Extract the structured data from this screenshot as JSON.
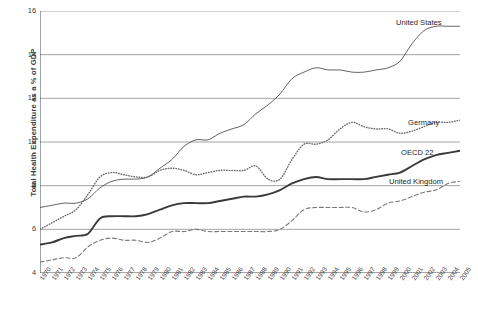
{
  "chart_data": {
    "type": "line",
    "title": "",
    "xlabel": "",
    "ylabel": "Total Health Expenditure as a % of GDP",
    "xlim": [
      1970,
      2005
    ],
    "ylim": [
      4,
      16
    ],
    "yticks": [
      4,
      6,
      8,
      10,
      12,
      14,
      16
    ],
    "grid": "horizontal",
    "legend_position": "inline-right-of-series",
    "x": [
      1970,
      1971,
      1972,
      1973,
      1974,
      1975,
      1976,
      1977,
      1978,
      1979,
      1980,
      1981,
      1982,
      1983,
      1984,
      1985,
      1986,
      1987,
      1988,
      1989,
      1990,
      1991,
      1992,
      1993,
      1994,
      1995,
      1996,
      1997,
      1998,
      1999,
      2000,
      2001,
      2002,
      2003,
      2004,
      2005
    ],
    "series": [
      {
        "name": "United States",
        "style": "solid-thin",
        "color": "#555555",
        "values": [
          7.0,
          7.1,
          7.2,
          7.2,
          7.4,
          7.9,
          8.2,
          8.3,
          8.3,
          8.4,
          8.8,
          9.2,
          9.8,
          10.1,
          10.1,
          10.4,
          10.6,
          10.8,
          11.3,
          11.7,
          12.2,
          12.9,
          13.2,
          13.4,
          13.3,
          13.3,
          13.2,
          13.2,
          13.3,
          13.4,
          13.7,
          14.5,
          15.1,
          15.3,
          15.3,
          15.3
        ]
      },
      {
        "name": "Germany",
        "style": "dotted",
        "color": "#6e6e6e",
        "values": [
          6.0,
          6.3,
          6.6,
          6.9,
          7.6,
          8.4,
          8.6,
          8.5,
          8.4,
          8.4,
          8.7,
          8.8,
          8.7,
          8.5,
          8.6,
          8.7,
          8.7,
          8.7,
          8.9,
          8.3,
          8.3,
          9.2,
          9.9,
          9.9,
          10.1,
          10.6,
          10.9,
          10.7,
          10.6,
          10.6,
          10.4,
          10.5,
          10.7,
          10.9,
          10.9,
          11.0
        ]
      },
      {
        "name": "OECD 22",
        "style": "solid-thick",
        "color": "#3a3a3a",
        "values": [
          5.3,
          5.4,
          5.6,
          5.7,
          5.8,
          6.5,
          6.6,
          6.6,
          6.6,
          6.7,
          6.9,
          7.1,
          7.2,
          7.2,
          7.2,
          7.3,
          7.4,
          7.5,
          7.5,
          7.6,
          7.8,
          8.1,
          8.3,
          8.4,
          8.3,
          8.3,
          8.3,
          8.3,
          8.4,
          8.5,
          8.6,
          8.9,
          9.2,
          9.4,
          9.5,
          9.6
        ]
      },
      {
        "name": "United Kingdom",
        "style": "dashed",
        "color": "#7a7a7a",
        "values": [
          4.5,
          4.6,
          4.7,
          4.7,
          5.2,
          5.5,
          5.6,
          5.5,
          5.5,
          5.4,
          5.6,
          5.9,
          5.9,
          6.0,
          5.9,
          5.9,
          5.9,
          5.9,
          5.9,
          5.9,
          6.0,
          6.4,
          6.9,
          7.0,
          7.0,
          7.0,
          7.0,
          6.8,
          6.9,
          7.2,
          7.3,
          7.5,
          7.7,
          7.8,
          8.1,
          8.2
        ]
      }
    ],
    "series_labels": [
      {
        "name": "United States",
        "x_px": 396,
        "y_px": 18
      },
      {
        "name": "Germany",
        "x_px": 408,
        "y_px": 118
      },
      {
        "name": "OECD 22",
        "x_px": 401,
        "y_px": 148
      },
      {
        "name": "United Kingdom",
        "x_px": 389,
        "y_px": 177
      }
    ]
  }
}
